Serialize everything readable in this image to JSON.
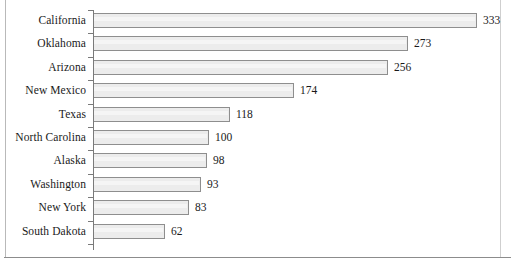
{
  "chart_data": {
    "type": "bar",
    "orientation": "horizontal",
    "title": "",
    "subtitle": "",
    "xlabel": "",
    "ylabel": "",
    "categories": [
      "California",
      "Oklahoma",
      "Arizona",
      "New Mexico",
      "Texas",
      "North Carolina",
      "Alaska",
      "Washington",
      "New York",
      "South Dakota"
    ],
    "values": [
      333,
      273,
      256,
      174,
      118,
      100,
      98,
      93,
      83,
      62
    ],
    "value_labels": [
      "333",
      "273",
      "256",
      "174",
      "118",
      "100",
      "98",
      "93",
      "83",
      "62"
    ],
    "xlim": [
      0,
      333
    ],
    "grid": false,
    "legend": null,
    "annotations": [],
    "style": {
      "bar_fill": "#ececec",
      "bar_border": "#8e8e8e",
      "axis_color": "#7a7a7a",
      "text_color": "#1a1a1a",
      "frame_color": "#8c8c8c",
      "background": "#ffffff"
    }
  }
}
